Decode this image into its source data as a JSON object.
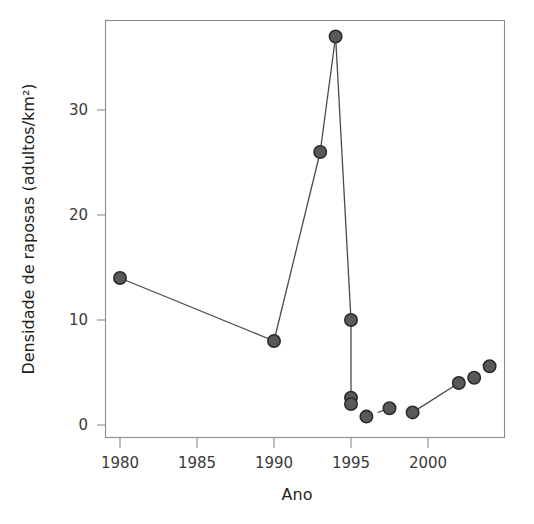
{
  "chart_data": {
    "type": "line",
    "title": "",
    "subtitle": "",
    "xlabel": "Ano",
    "ylabel": "Densidade de raposas (adultos/km²)",
    "xlim": [
      1978.2,
      2005.0
    ],
    "ylim": [
      -0.6,
      38.5
    ],
    "grid": false,
    "legend": "none",
    "xticks": [
      1980,
      1985,
      1990,
      1995,
      2000
    ],
    "xticklabels": [
      "1980",
      "1985",
      "1990",
      "1995",
      "2000"
    ],
    "yticks": [
      0,
      10,
      20,
      30
    ],
    "yticklabels": [
      "0",
      "10",
      "20",
      "30"
    ],
    "marker": "filled-circle",
    "marker_color": "#59595b",
    "marker_edge_color": "#2c2c2e",
    "line_color": "#4a4a4a",
    "frame_color": "#8c8c8c",
    "x": [
      1980,
      1990,
      1993,
      1994,
      1995,
      1995,
      1995,
      1996,
      1997.5,
      1999,
      2002,
      2003,
      2004
    ],
    "values": [
      14,
      8,
      26,
      37,
      10,
      2.6,
      2,
      0.8,
      1.6,
      1.2,
      4,
      4.5,
      5.6
    ],
    "series": [
      {
        "name": "Densidade de raposas",
        "points": [
          {
            "x": 1980,
            "y": 14
          },
          {
            "x": 1990,
            "y": 8
          },
          {
            "x": 1993,
            "y": 26
          },
          {
            "x": 1994,
            "y": 37
          },
          {
            "x": 1995,
            "y": 10
          },
          {
            "x": 1995,
            "y": 2.6
          },
          {
            "x": 1995,
            "y": 2
          },
          {
            "x": 1996,
            "y": 0.8
          },
          {
            "x": 1997.5,
            "y": 1.6
          },
          {
            "x": 1999,
            "y": 1.2
          },
          {
            "x": 2002,
            "y": 4
          },
          {
            "x": 2003,
            "y": 4.5
          },
          {
            "x": 2004,
            "y": 5.6
          }
        ]
      }
    ],
    "segments": [
      {
        "style": "solid",
        "from": {
          "x": 1980,
          "y": 14
        },
        "to": {
          "x": 1990,
          "y": 8
        }
      },
      {
        "style": "solid",
        "from": {
          "x": 1990,
          "y": 8
        },
        "to": {
          "x": 1993,
          "y": 26
        }
      },
      {
        "style": "solid",
        "from": {
          "x": 1993,
          "y": 26
        },
        "to": {
          "x": 1994,
          "y": 37
        }
      },
      {
        "style": "solid",
        "from": {
          "x": 1994,
          "y": 37
        },
        "to": {
          "x": 1995,
          "y": 10
        }
      },
      {
        "style": "solid",
        "from": {
          "x": 1995,
          "y": 10
        },
        "to": {
          "x": 1995,
          "y": 2.6
        }
      },
      {
        "style": "dashed",
        "from": {
          "x": 1996,
          "y": 0.8
        },
        "to": {
          "x": 1997.5,
          "y": 1.6
        }
      },
      {
        "style": "solid",
        "from": {
          "x": 1999,
          "y": 1.2
        },
        "to": {
          "x": 2002,
          "y": 4
        }
      }
    ]
  }
}
